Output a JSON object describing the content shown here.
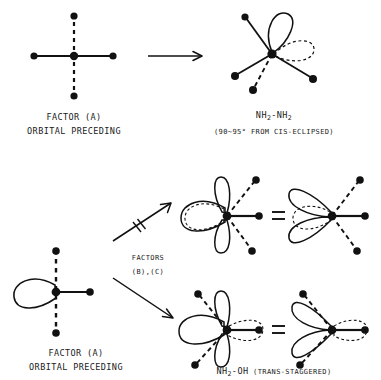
{
  "figure": {
    "type": "chemical-orbital-diagram"
  },
  "top_row": {
    "reactant_label_line1": "FACTOR (A)",
    "reactant_label_line2": "ORBITAL PRECEDING",
    "arrow": "right-arrow",
    "product_formula_pre": "NH",
    "product_formula_sub1": "2",
    "product_formula_mid": "-NH",
    "product_formula_sub2": "2",
    "product_note": "(90~95° FROM CIS-ECLIPSED)"
  },
  "bottom_row": {
    "reactant_label_line1": "FACTOR (A)",
    "reactant_label_line2": "ORBITAL PRECEDING",
    "branch_label_line1": "FACTORS",
    "branch_label_line2": "(B),(C)",
    "upper_arrow": "crossed-out-arrow",
    "lower_arrow": "right-arrow",
    "equals_upper": "=",
    "equals_lower": "=",
    "product_formula_pre": "NH",
    "product_formula_sub": "2",
    "product_formula_post": "-OH",
    "product_note": "(TRANS-STAGGERED)"
  },
  "colors": {
    "ink": "#111111",
    "background": "#ffffff"
  }
}
